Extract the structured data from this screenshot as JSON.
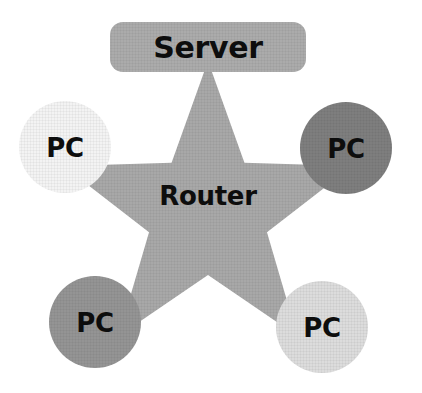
{
  "diagram": {
    "type": "star-network-topology",
    "background_color": "#FFFFFF",
    "hub": {
      "name": "router-hub",
      "label": "Router",
      "shape": "five-pointed-star",
      "fill_color": "#A8A8A8",
      "text_color": "#0D0D0D",
      "center_x": 208,
      "center_y": 213,
      "outer_radius": 152,
      "inner_radius": 62,
      "label_x": 208,
      "label_y": 196
    },
    "server": {
      "name": "server-node",
      "label": "Server",
      "shape": "rounded-rectangle",
      "fill_color": "#ABABAB",
      "text_color": "#0D0D0D",
      "x": 110,
      "y": 22,
      "width": 196,
      "height": 50,
      "corner_radius": 13,
      "label_x": 208,
      "label_y": 47
    },
    "clients": [
      {
        "name": "pc-top-left",
        "label": "PC",
        "shape": "circle",
        "fill_color": "#F3F3F3",
        "text_color": "#0D0D0D",
        "cx": 65,
        "cy": 147,
        "r": 46,
        "position": "top-left"
      },
      {
        "name": "pc-top-right",
        "label": "PC",
        "shape": "circle",
        "fill_color": "#7E7E7E",
        "text_color": "#0D0D0D",
        "cx": 346,
        "cy": 148,
        "r": 46,
        "position": "top-right"
      },
      {
        "name": "pc-bottom-left",
        "label": "PC",
        "shape": "circle",
        "fill_color": "#949494",
        "text_color": "#0D0D0D",
        "cx": 95,
        "cy": 322,
        "r": 46,
        "position": "bottom-left"
      },
      {
        "name": "pc-bottom-right",
        "label": "PC",
        "shape": "circle",
        "fill_color": "#DCDCDC",
        "text_color": "#0D0D0D",
        "cx": 322,
        "cy": 327,
        "r": 46,
        "position": "bottom-right"
      }
    ],
    "connections": [
      {
        "from": "router-hub",
        "to": "server-node",
        "via": "star-point-top"
      },
      {
        "from": "router-hub",
        "to": "pc-top-left",
        "via": "star-point-upper-left"
      },
      {
        "from": "router-hub",
        "to": "pc-top-right",
        "via": "star-point-upper-right"
      },
      {
        "from": "router-hub",
        "to": "pc-bottom-left",
        "via": "star-point-lower-left"
      },
      {
        "from": "router-hub",
        "to": "pc-bottom-right",
        "via": "star-point-lower-right"
      }
    ]
  }
}
